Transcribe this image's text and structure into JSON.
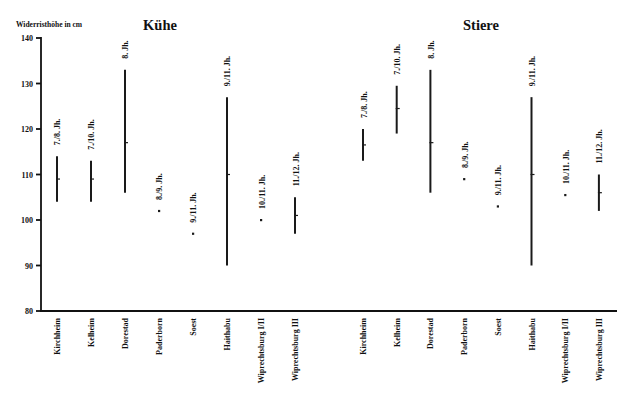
{
  "chart_data": {
    "type": "bar",
    "subtype": "floating range (min–max) with mean marker",
    "title": "",
    "ylabel": "Widerristhöhe in cm",
    "xlabel": "",
    "ylim": [
      80,
      140
    ],
    "yticks": [
      80,
      90,
      100,
      110,
      120,
      130,
      140
    ],
    "grid": false,
    "legend": null,
    "panels": [
      {
        "title": "Kühe",
        "sites": [
          {
            "site": "Kirchheim",
            "period": "7./8. Jh.",
            "min": 104,
            "max": 114,
            "mean": 109
          },
          {
            "site": "Kelheim",
            "period": "7./10. Jh.",
            "min": 104,
            "max": 113,
            "mean": 109
          },
          {
            "site": "Dorestad",
            "period": "8. Jh.",
            "min": 106,
            "max": 133,
            "mean": 117
          },
          {
            "site": "Paderborn",
            "period": "8./9. Jh.",
            "value": 102
          },
          {
            "site": "Soest",
            "period": "9./11. Jh.",
            "value": 97
          },
          {
            "site": "Haithabu",
            "period": "9./11. Jh.",
            "min": 90,
            "max": 127,
            "mean": 110
          },
          {
            "site": "Wiprechtsburg I/II",
            "period": "10./11. Jh.",
            "value": 100
          },
          {
            "site": "Wiprechtsburg III",
            "period": "11./12. Jh.",
            "min": 97,
            "max": 105,
            "mean": 101
          }
        ]
      },
      {
        "title": "Stiere",
        "sites": [
          {
            "site": "Kirchheim",
            "period": "7./8. Jh.",
            "min": 113,
            "max": 120,
            "mean": 116.5
          },
          {
            "site": "Kelheim",
            "period": "7./10. Jh.",
            "min": 119,
            "max": 129.5,
            "mean": 124.5
          },
          {
            "site": "Dorestad",
            "period": "8. Jh.",
            "min": 106,
            "max": 133,
            "mean": 117
          },
          {
            "site": "Paderborn",
            "period": "8./9. Jh.",
            "value": 109
          },
          {
            "site": "Soest",
            "period": "9./11. Jh.",
            "value": 103
          },
          {
            "site": "Haithabu",
            "period": "9./11. Jh.",
            "min": 90,
            "max": 127,
            "mean": 110
          },
          {
            "site": "Wiprechtsburg I/II",
            "period": "10./11. Jh.",
            "value": 105.5
          },
          {
            "site": "Wiprechtsburg III",
            "period": "11./12. Jh.",
            "min": 102,
            "max": 110,
            "mean": 106
          }
        ]
      }
    ]
  }
}
